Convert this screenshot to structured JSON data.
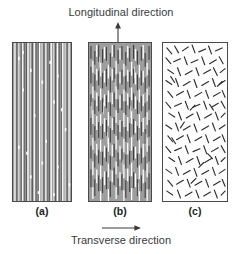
{
  "figure": {
    "type": "diagram",
    "background_color": "#ffffff"
  },
  "axes_labels": {
    "longitudinal": "Longitudinal direction",
    "transverse": "Transverse direction",
    "arrow_up_name": "arrow-up-icon",
    "arrow_right_name": "arrow-right-icon"
  },
  "panels": [
    {
      "id": "a",
      "caption": "(a)",
      "description": "continuous and aligned fibers",
      "fiber_mode": "continuous-aligned",
      "matrix_color": "#9d9d9d",
      "fiber_colors": [
        "#ffffff",
        "#3c3c3c",
        "#6e6e6e",
        "#d6d6d6"
      ],
      "border_color": "#4a4a4a"
    },
    {
      "id": "b",
      "caption": "(b)",
      "description": "discontinuous and aligned fibers",
      "fiber_mode": "discontinuous-aligned",
      "matrix_color": "#9d9d9d",
      "fiber_colors": [
        "#ffffff",
        "#3c3c3c",
        "#6e6e6e",
        "#d6d6d6"
      ],
      "border_color": "#4a4a4a"
    },
    {
      "id": "c",
      "caption": "(c)",
      "description": "discontinuous and randomly oriented fibers",
      "fiber_mode": "discontinuous-random",
      "matrix_color": "#fdfdfd",
      "fiber_colors": [
        "#2a2a2a"
      ],
      "border_color": "#4a4a4a"
    }
  ]
}
